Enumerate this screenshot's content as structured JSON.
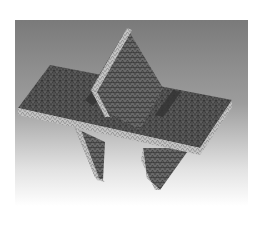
{
  "image": {
    "subject": "3D finite-element tetrahedral mesh of two intersecting plates",
    "background": {
      "top_color": "#7c7c7c",
      "bottom_color": "#ffffff"
    },
    "colors": {
      "face_fill": "#5e5e5e",
      "face_shadow": "#3a3a3a",
      "edge_fill": "#bdbdbd",
      "mesh_line": "#2a2a2a"
    }
  }
}
